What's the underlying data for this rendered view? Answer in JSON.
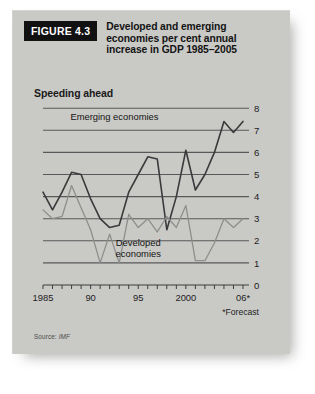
{
  "figure": {
    "tag": "FIGURE 4.3",
    "title_lines": [
      "Developed and emerging",
      "economies per cent annual",
      "increase in GDP 1985–2005"
    ],
    "subtitle": "Speeding ahead",
    "source_label": "Source:",
    "source_value": "IMF",
    "footnote": "*Forecast"
  },
  "colors": {
    "panel_bg": "#c9c9c6",
    "page_bg": "#ffffff",
    "tag_bg": "#111111",
    "tag_text": "#ffffff",
    "gridline": "#58585a",
    "axis": "#3c3c3e",
    "emerging_line": "#3a3a3c",
    "developed_line": "#8e8e8c",
    "label_text": "#1a1a1a"
  },
  "chart_data": {
    "type": "line",
    "title": "Speeding ahead",
    "subtitle": "Developed and emerging economies per cent annual increase in GDP 1985–2005",
    "xlabel": "",
    "ylabel": "",
    "ylim": [
      0,
      8
    ],
    "xlim": [
      1985,
      2006
    ],
    "grid": true,
    "grid_axis": "y",
    "legend_position": "inline-annotation",
    "y_ticks": [
      0,
      1,
      2,
      3,
      4,
      5,
      6,
      7,
      8
    ],
    "y_tick_labels": [
      "0",
      "1",
      "2",
      "3",
      "4",
      "5",
      "6",
      "7",
      "8"
    ],
    "y_axis_side": "right",
    "x_ticks": [
      1985,
      1986,
      1987,
      1988,
      1989,
      1990,
      1991,
      1992,
      1993,
      1994,
      1995,
      1996,
      1997,
      1998,
      1999,
      2000,
      2001,
      2002,
      2003,
      2004,
      2005,
      2006
    ],
    "x_tick_labels_shown": [
      {
        "x": 1985,
        "label": "1985"
      },
      {
        "x": 1990,
        "label": "90"
      },
      {
        "x": 1995,
        "label": "95"
      },
      {
        "x": 2000,
        "label": "2000"
      },
      {
        "x": 2006,
        "label": "06*"
      }
    ],
    "annotations": [
      {
        "text": "Emerging economies",
        "x": 1992.5,
        "y": 7.45
      },
      {
        "text": "Developed economies",
        "x": 1995.0,
        "y": 1.75
      },
      {
        "text": "*Forecast",
        "x": 2006,
        "y": -0.55
      }
    ],
    "series": [
      {
        "name": "Emerging economies",
        "color": "#3a3a3c",
        "x": [
          1985,
          1986,
          1987,
          1988,
          1989,
          1990,
          1991,
          1992,
          1993,
          1994,
          1995,
          1996,
          1997,
          1998,
          1999,
          2000,
          2001,
          2002,
          2003,
          2004,
          2005,
          2006
        ],
        "values": [
          4.2,
          3.4,
          4.2,
          5.1,
          5.0,
          3.9,
          3.0,
          2.6,
          2.7,
          4.2,
          5.0,
          5.8,
          5.7,
          2.5,
          4.0,
          6.1,
          4.3,
          5.0,
          6.0,
          7.4,
          6.9,
          7.4
        ]
      },
      {
        "name": "Developed economies",
        "color": "#8e8e8c",
        "x": [
          1985,
          1986,
          1987,
          1988,
          1989,
          1990,
          1991,
          1992,
          1993,
          1994,
          1995,
          1996,
          1997,
          1998,
          1999,
          2000,
          2001,
          2002,
          2003,
          2004,
          2005,
          2006
        ],
        "values": [
          3.4,
          3.0,
          3.1,
          4.5,
          3.5,
          2.5,
          1.0,
          2.3,
          1.0,
          3.2,
          2.6,
          3.0,
          2.4,
          3.1,
          2.6,
          3.6,
          1.1,
          1.1,
          1.9,
          3.0,
          2.6,
          3.0
        ]
      }
    ]
  }
}
